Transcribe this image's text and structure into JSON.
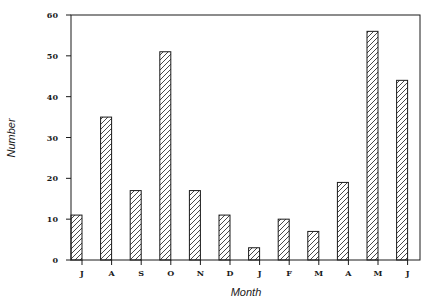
{
  "chart_data": {
    "type": "bar",
    "title": "",
    "xlabel": "Month",
    "ylabel": "Number",
    "categories": [
      "J",
      "A",
      "S",
      "O",
      "N",
      "D",
      "J",
      "F",
      "M",
      "A",
      "M",
      "J"
    ],
    "values": [
      11,
      35,
      17,
      51,
      17,
      11,
      3,
      10,
      7,
      19,
      56,
      44
    ],
    "ylim": [
      0,
      60
    ],
    "yticks": [
      0,
      10,
      20,
      30,
      40,
      50,
      60
    ],
    "grid": false,
    "legend": null,
    "bar_fill": "diagonal-hatch",
    "colors": {
      "stroke": "#1a1a1a",
      "background": "#ffffff"
    }
  }
}
